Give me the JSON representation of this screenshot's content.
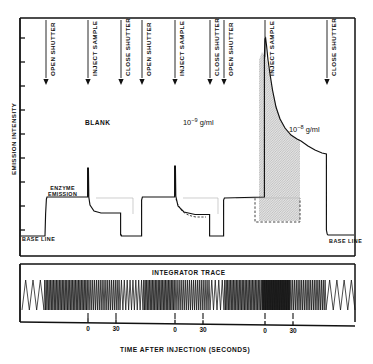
{
  "figure": {
    "axis_y_label": "EMISSION INTENSITY",
    "axis_x_label": "TIME AFTER INJECTION (SECONDS)",
    "panel_lower_title": "INTEGRATOR TRACE",
    "ink_color": "#111111",
    "fill_color": "#d8d8d8"
  },
  "event_markers": [
    {
      "label": "OPEN SHUTTER",
      "x": 46
    },
    {
      "label": "INJECT SAMPLE",
      "x": 88
    },
    {
      "label": "CLOSE SHUTTER",
      "x": 121
    },
    {
      "label": "OPEN SHUTTER",
      "x": 142
    },
    {
      "label": "INJECT SAMPLE",
      "x": 175
    },
    {
      "label": "CLOSE SHUTTER",
      "x": 210
    },
    {
      "label": "OPEN SHUTTER",
      "x": 224
    },
    {
      "label": "INJECT SAMPLE",
      "x": 265
    },
    {
      "label": "CLOSE SHUTTER",
      "x": 327
    }
  ],
  "annotations": {
    "blank": "BLANK",
    "enzyme_emission_line1": "ENZYME",
    "enzyme_emission_line2": "EMISSION",
    "base_line_left": "BASE LINE",
    "base_line_right": "BASE LINE",
    "conc_mid_mantissa": "10",
    "conc_mid_exponent": "−9",
    "conc_mid_units": "g/ml",
    "conc_right_mantissa": "10",
    "conc_right_exponent": "−8",
    "conc_right_units": "g/ml"
  },
  "x_axis": {
    "tick_labels": [
      "0",
      "30",
      "0",
      "30",
      "0",
      "30"
    ],
    "tick_x": [
      88,
      116,
      175,
      203,
      265,
      293
    ]
  },
  "chart_data": {
    "type": "line",
    "title": "",
    "xlabel": "TIME AFTER INJECTION (SECONDS)",
    "ylabel": "EMISSION INTENSITY",
    "grid": false,
    "legend": "none",
    "axis_note": "Strip-chart recorder trace; x is elapsed time with three injection cycles, y is relative emission intensity (arbitrary units).",
    "xlim": [
      20,
      355
    ],
    "ylim": [
      0,
      100
    ],
    "y_tick_count": 9,
    "series": [
      {
        "name": "emission trace",
        "comment": "Polyline in figure pixel space (x px, y px). Baseline y=235, enzyme plateau y=198, blank level y=213.",
        "points": [
          [
            22,
            236
          ],
          [
            45,
            236
          ],
          [
            46,
            198
          ],
          [
            47,
            197
          ],
          [
            88,
            197
          ],
          [
            88,
            168
          ],
          [
            89,
            197
          ],
          [
            90,
            204
          ],
          [
            95,
            212
          ],
          [
            110,
            213
          ],
          [
            121,
            213
          ],
          [
            121,
            235
          ],
          [
            142,
            235
          ],
          [
            142,
            199
          ],
          [
            143,
            197
          ],
          [
            175,
            197
          ],
          [
            175,
            166
          ],
          [
            176,
            196
          ],
          [
            178,
            205
          ],
          [
            184,
            211
          ],
          [
            196,
            214
          ],
          [
            210,
            214
          ],
          [
            210,
            236
          ],
          [
            224,
            236
          ],
          [
            224,
            198
          ],
          [
            265,
            197
          ],
          [
            265,
            38
          ],
          [
            267,
            40
          ],
          [
            269,
            62
          ],
          [
            272,
            86
          ],
          [
            277,
            110
          ],
          [
            284,
            126
          ],
          [
            291,
            135
          ],
          [
            300,
            139
          ],
          [
            312,
            148
          ],
          [
            322,
            153
          ],
          [
            327,
            154
          ],
          [
            327,
            234
          ],
          [
            355,
            234
          ]
        ]
      },
      {
        "name": "dashed reference (10^-9)",
        "style": "dashed",
        "points": [
          [
            175,
            197
          ],
          [
            178,
            207
          ],
          [
            184,
            213
          ],
          [
            196,
            216
          ],
          [
            206,
            216
          ]
        ]
      },
      {
        "name": "dashed baseline box (10^-8)",
        "style": "dashed",
        "points": [
          [
            255,
            197
          ],
          [
            255,
            222
          ],
          [
            300,
            222
          ],
          [
            300,
            197
          ]
        ]
      }
    ],
    "shaded_region": {
      "label": "integrated peak area (10^-8 g/ml)",
      "x_range_px": [
        259,
        300
      ],
      "top_curve": "emission trace",
      "bottom_px": 221
    },
    "integrator_trace": {
      "type": "oscillation",
      "description": "Sawtooth integrator pen trace; oscillation frequency is proportional to emission intensity.",
      "segments": [
        {
          "x_from": 22,
          "x_to": 44,
          "cycles": 3,
          "density": "low"
        },
        {
          "x_from": 44,
          "x_to": 88,
          "cycles": 30,
          "density": "high"
        },
        {
          "x_from": 88,
          "x_to": 120,
          "cycles": 17,
          "density": "medium"
        },
        {
          "x_from": 120,
          "x_to": 143,
          "cycles": 8,
          "density": "low"
        },
        {
          "x_from": 143,
          "x_to": 175,
          "cycles": 22,
          "density": "medium-high"
        },
        {
          "x_from": 175,
          "x_to": 210,
          "cycles": 18,
          "density": "medium"
        },
        {
          "x_from": 210,
          "x_to": 224,
          "cycles": 4,
          "density": "low"
        },
        {
          "x_from": 224,
          "x_to": 262,
          "cycles": 26,
          "density": "medium-high"
        },
        {
          "x_from": 262,
          "x_to": 290,
          "cycles": 40,
          "density": "very-high"
        },
        {
          "x_from": 290,
          "x_to": 326,
          "cycles": 20,
          "density": "medium"
        },
        {
          "x_from": 326,
          "x_to": 355,
          "cycles": 4,
          "density": "low"
        }
      ]
    }
  }
}
